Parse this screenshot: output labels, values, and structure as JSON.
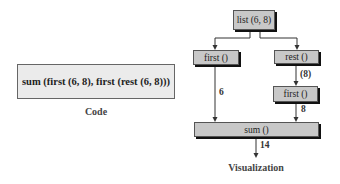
{
  "code": {
    "expression": "sum (first (6, 8), first (rest (6, 8)))",
    "caption": "Code"
  },
  "visualization": {
    "caption": "Visualization",
    "nodes": {
      "list": "list (6, 8)",
      "first_left": "first ()",
      "rest": "rest ()",
      "first_right": "first ()",
      "sum": "sum ()"
    },
    "edge_labels": {
      "first_to_sum": "6",
      "rest_to_first": "(8)",
      "first_right_to_sum": "8",
      "sum_output": "14"
    }
  },
  "colors": {
    "node_fill": "#c8c8c8",
    "code_fill": "#ebebeb",
    "stroke": "#333333"
  }
}
